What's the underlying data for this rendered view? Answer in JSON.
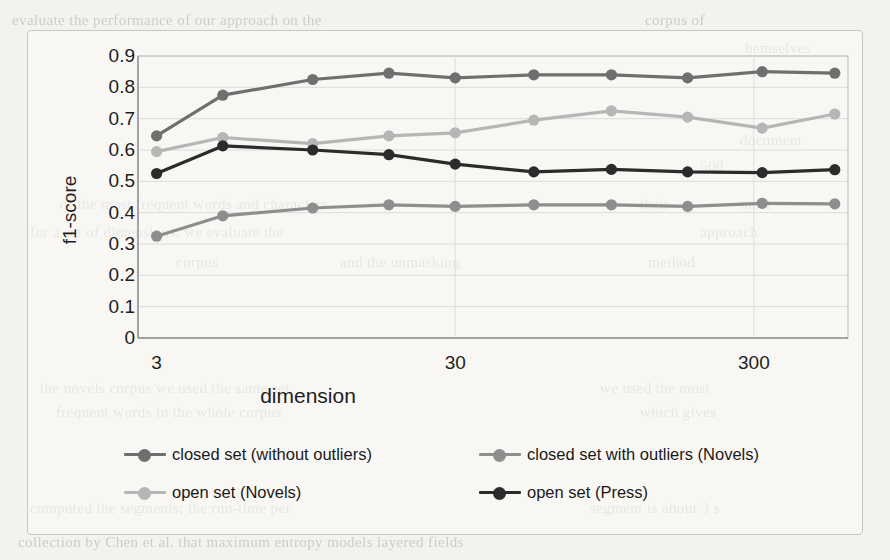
{
  "figure": {
    "background_color": "#f3f2ee",
    "frame_color": "#c9c7c1"
  },
  "chart_data": {
    "type": "line",
    "title": "",
    "subtitle": "",
    "xlabel": "dimension",
    "ylabel": "f1-score",
    "x_scale": "log",
    "x_tick_labels": [
      "3",
      "30",
      "300"
    ],
    "x_tick_values": [
      3,
      30,
      300
    ],
    "xlim": [
      2.6,
      620
    ],
    "y_tick_labels": [
      "0",
      "0.1",
      "0.2",
      "0.3",
      "0.4",
      "0.5",
      "0.6",
      "0.7",
      "0.8",
      "0.9"
    ],
    "y_tick_values": [
      0,
      0.1,
      0.2,
      0.3,
      0.4,
      0.5,
      0.6,
      0.7,
      0.8,
      0.9
    ],
    "ylim": [
      0,
      0.9
    ],
    "grid": "horizontal",
    "legend_position": "bottom",
    "x": [
      3,
      5,
      10,
      18,
      30,
      55,
      100,
      180,
      320,
      560
    ],
    "series": [
      {
        "name": "closed set (without outliers)",
        "color": "#6f6f6f",
        "marker": "circle",
        "values": [
          0.645,
          0.775,
          0.825,
          0.845,
          0.83,
          0.84,
          0.84,
          0.83,
          0.85,
          0.845
        ]
      },
      {
        "name": "closed set with outliers  (Novels)",
        "color": "#8e8e8e",
        "marker": "circle",
        "values": [
          0.325,
          0.39,
          0.415,
          0.425,
          0.42,
          0.425,
          0.425,
          0.42,
          0.43,
          0.428
        ]
      },
      {
        "name": "open set (Novels)",
        "color": "#b6b6b6",
        "marker": "circle",
        "values": [
          0.595,
          0.64,
          0.62,
          0.645,
          0.655,
          0.695,
          0.725,
          0.705,
          0.67,
          0.715
        ]
      },
      {
        "name": "open set (Press)",
        "color": "#2b2b2b",
        "marker": "circle",
        "values": [
          0.525,
          0.613,
          0.6,
          0.585,
          0.555,
          0.53,
          0.538,
          0.53,
          0.528,
          0.537
        ]
      }
    ]
  },
  "legend": {
    "items": [
      {
        "label": "closed set (without outliers)",
        "color": "#6f6f6f"
      },
      {
        "label": "closed set with outliers  (Novels)",
        "color": "#8e8e8e"
      },
      {
        "label": "open set (Novels)",
        "color": "#b6b6b6"
      },
      {
        "label": "open set (Press)",
        "color": "#2b2b2b"
      }
    ]
  },
  "page_background_text": [
    {
      "text": "evaluate the performance of our approach on the",
      "x": 12,
      "y": 12
    },
    {
      "text": "corpus of",
      "x": 645,
      "y": 12
    },
    {
      "text": "hemselves",
      "x": 745,
      "y": 40
    },
    {
      "text": "document",
      "x": 740,
      "y": 132
    },
    {
      "text": "500",
      "x": 700,
      "y": 158
    },
    {
      "text": "of the most frequent words and characters",
      "x": 60,
      "y": 196
    },
    {
      "text": "their",
      "x": 640,
      "y": 196
    },
    {
      "text": "most",
      "x": 740,
      "y": 196
    },
    {
      "text": "for a set of dimensions, we evaluate the",
      "x": 30,
      "y": 224
    },
    {
      "text": "approach",
      "x": 700,
      "y": 224
    },
    {
      "text": "corpus",
      "x": 176,
      "y": 254
    },
    {
      "text": "and the unmasking",
      "x": 340,
      "y": 254
    },
    {
      "text": "method",
      "x": 648,
      "y": 254
    },
    {
      "text": "the novels corpus we used the same set",
      "x": 40,
      "y": 380
    },
    {
      "text": "we used the most",
      "x": 600,
      "y": 380
    },
    {
      "text": "frequent words in the whole corpus",
      "x": 56,
      "y": 404
    },
    {
      "text": "which gives",
      "x": 640,
      "y": 404
    },
    {
      "text": "computed the segments; the run-time per",
      "x": 30,
      "y": 500
    },
    {
      "text": "segment is about 3 s",
      "x": 590,
      "y": 500
    },
    {
      "text": "collection by Chen et al. that maximum entropy models layered fields",
      "x": 18,
      "y": 534
    }
  ]
}
